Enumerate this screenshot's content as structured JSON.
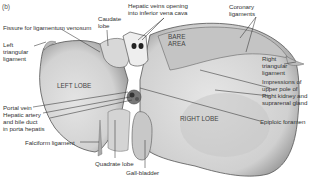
{
  "figure": {
    "panel_label": "(b)",
    "colors": {
      "liver_fill": "#d9d9d9",
      "liver_shade": "#b8b8b8",
      "outline": "#555555",
      "leader_line": "#333333",
      "text": "#333333"
    }
  },
  "labels": {
    "fissure": "Fissure for ligamentum venosum",
    "caudate": "Caudate\nlobe",
    "hepatic_veins": "Hepatic veins opening\ninto inferior vena cava",
    "coronary": "Coronary\nligaments",
    "left_triangular": "Left\ntriangular\nligament",
    "bare_area": "BARE\nAREA",
    "right_triangular": "Right\ntriangular\nligament",
    "left_lobe": "LEFT LOBE",
    "impressions": "Impressions of\nupper pole of\nRight kidney and\nsuprarenal gland",
    "portal_vein": "Portal vein",
    "hepatic_artery": "Hepatic artery\nand bile duct\nin porta hepatis",
    "right_lobe": "RIGHT LOBE",
    "epiploic": "Epiploic foramen",
    "falciform": "Falciform ligament",
    "quadrate": "Quadrate lobe",
    "gallbladder": "Gall-bladder"
  }
}
